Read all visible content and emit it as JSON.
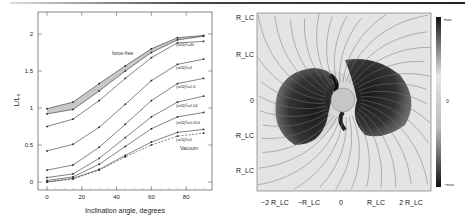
{
  "figure": {
    "left_panel": {
      "xlabel": "Inclination angle, degrees",
      "ylabel": "L/L₀",
      "xticks": [
        "0",
        "20",
        "40",
        "60",
        "80"
      ],
      "yticks": [
        "0",
        "0.5",
        "1",
        "1.5",
        "2"
      ],
      "annotations": {
        "force_free": "force-free",
        "vacuum": "Vacuum"
      },
      "series_labels": [
        "(σ/Ω)²=40",
        "(σ/Ω)²=4",
        "(σ/Ω)²=0.4",
        "(σ/Ω)²=0.04",
        "(σ/Ω)²=0.004",
        "(σ/Ω)²=0"
      ]
    },
    "right_panel": {
      "xticks": [
        "−2 R_LC",
        "−R_LC",
        "0",
        "R_LC",
        "2 R_LC"
      ],
      "yticks": [
        "2 R_LC",
        "R_LC",
        "0",
        "−R_LC",
        "−2 R_LC"
      ],
      "colorbar": {
        "top": "max",
        "mid": "0",
        "bottom": "−max"
      }
    }
  },
  "chart_data": [
    {
      "type": "line",
      "title": "",
      "xlabel": "Inclination angle, degrees",
      "ylabel": "L/L0",
      "x": [
        0,
        15,
        30,
        45,
        60,
        75,
        90
      ],
      "xlim": [
        -5,
        95
      ],
      "ylim": [
        -0.1,
        2.3
      ],
      "grid": false,
      "series": [
        {
          "name": "force-free (upper)",
          "values": [
            0.99,
            1.08,
            1.33,
            1.57,
            1.8,
            1.95,
            1.98
          ]
        },
        {
          "name": "force-free (lower)",
          "values": [
            0.92,
            0.98,
            1.23,
            1.5,
            1.75,
            1.92,
            1.97
          ]
        },
        {
          "name": "(σ/Ω)²=40",
          "values": [
            0.75,
            0.85,
            1.1,
            1.4,
            1.68,
            1.88,
            1.9
          ]
        },
        {
          "name": "(σ/Ω)²=4",
          "values": [
            0.42,
            0.51,
            0.74,
            1.05,
            1.37,
            1.59,
            1.66
          ]
        },
        {
          "name": "(σ/Ω)²=0.4",
          "values": [
            0.16,
            0.23,
            0.47,
            0.78,
            1.1,
            1.33,
            1.4
          ]
        },
        {
          "name": "(σ/Ω)²=0.04",
          "values": [
            0.06,
            0.11,
            0.32,
            0.6,
            0.88,
            1.08,
            1.16
          ]
        },
        {
          "name": "(σ/Ω)²=0.004",
          "values": [
            0.02,
            0.07,
            0.24,
            0.48,
            0.72,
            0.88,
            0.94
          ]
        },
        {
          "name": "(σ/Ω)²=0",
          "values": [
            0.0,
            0.05,
            0.17,
            0.36,
            0.54,
            0.67,
            0.71
          ]
        },
        {
          "name": "Vacuum",
          "values": [
            0.0,
            0.04,
            0.16,
            0.34,
            0.5,
            0.62,
            0.66
          ],
          "style": "dashed"
        }
      ],
      "annotations": [
        "force-free",
        "Vacuum"
      ]
    },
    {
      "type": "heatmap",
      "title": "",
      "xticks": [
        "-2 R_LC",
        "-R_LC",
        "0",
        "R_LC",
        "2 R_LC"
      ],
      "yticks": [
        "2 R_LC",
        "R_LC",
        "0",
        "-R_LC",
        "-2 R_LC"
      ],
      "colorbar": [
        "max",
        "0",
        "-max"
      ],
      "description": "Grayscale field map with streamlines/arrows; dark two-lobed structure around central star"
    }
  ]
}
